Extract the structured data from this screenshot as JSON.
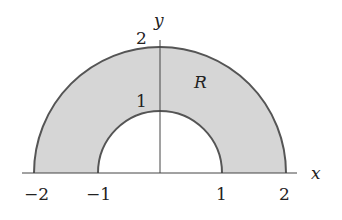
{
  "diagram": {
    "type": "region-plot",
    "region_label": "R",
    "axes": {
      "x_label": "x",
      "y_label": "y",
      "x_ticks": [
        "−2",
        "−1",
        "1",
        "2"
      ],
      "y_ticks": [
        "1",
        "2"
      ]
    },
    "inner_radius": 1,
    "outer_radius": 2,
    "colors": {
      "fill": "#d6d6d6",
      "stroke": "#555555",
      "axis": "#444444"
    }
  }
}
